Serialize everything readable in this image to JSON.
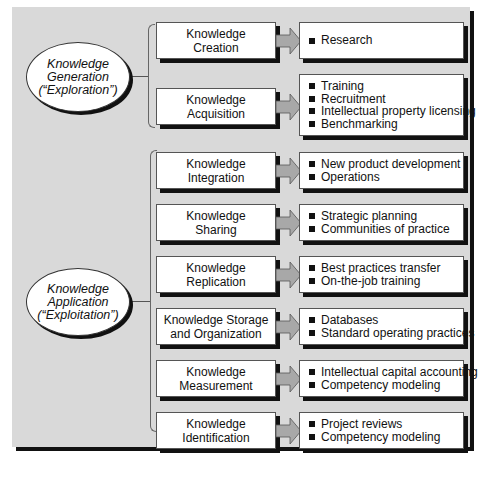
{
  "diagram": {
    "colors": {
      "background": "#d9d9d9",
      "box": "#ffffff",
      "shadow": "#111111",
      "arrow": "#a8a8a8"
    },
    "groups": [
      {
        "label_lines": [
          "Knowledge",
          "Generation",
          "(“Exploration”)"
        ],
        "processes": [
          {
            "name_lines": [
              "Knowledge",
              "Creation"
            ],
            "examples": [
              "Research"
            ]
          },
          {
            "name_lines": [
              "Knowledge",
              "Acquisition"
            ],
            "examples": [
              "Training",
              "Recruitment",
              "Intellectual property licensing",
              "Benchmarking"
            ]
          }
        ]
      },
      {
        "label_lines": [
          "Knowledge",
          "Application",
          "(“Exploitation”)"
        ],
        "processes": [
          {
            "name_lines": [
              "Knowledge",
              "Integration"
            ],
            "examples": [
              "New product development",
              "Operations"
            ]
          },
          {
            "name_lines": [
              "Knowledge",
              "Sharing"
            ],
            "examples": [
              "Strategic planning",
              "Communities of practice"
            ]
          },
          {
            "name_lines": [
              "Knowledge",
              "Replication"
            ],
            "examples": [
              "Best practices transfer",
              "On-the-job training"
            ]
          },
          {
            "name_lines": [
              "Knowledge Storage",
              "and Organization"
            ],
            "examples": [
              "Databases",
              "Standard operating practices"
            ]
          },
          {
            "name_lines": [
              "Knowledge",
              "Measurement"
            ],
            "examples": [
              "Intellectual capital accounting",
              "Competency modeling"
            ]
          },
          {
            "name_lines": [
              "Knowledge",
              "Identification"
            ],
            "examples": [
              "Project reviews",
              "Competency modeling"
            ]
          }
        ]
      }
    ]
  }
}
